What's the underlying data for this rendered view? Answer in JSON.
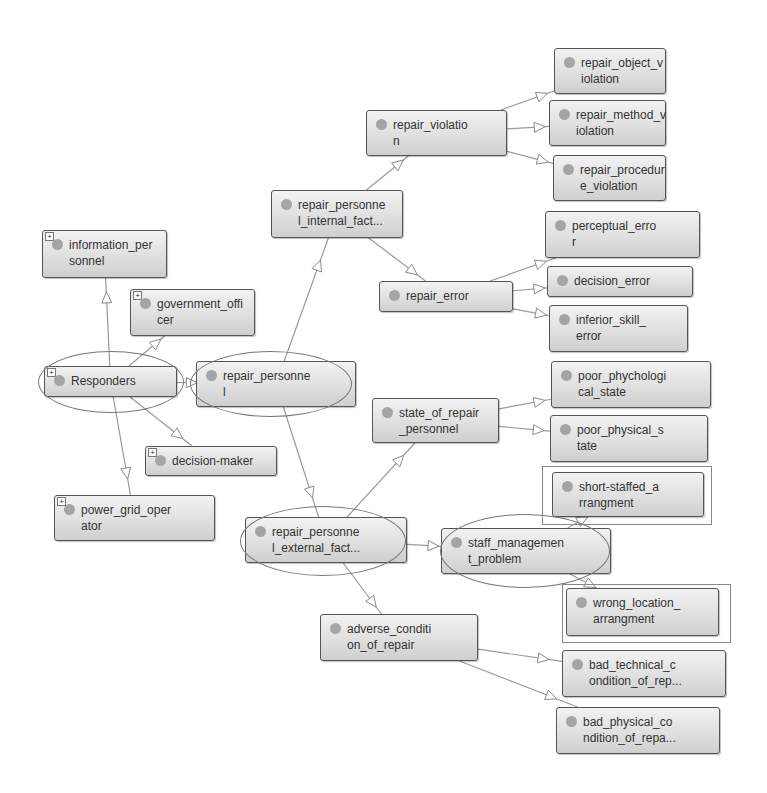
{
  "diagram": {
    "type": "ontology-class-hierarchy",
    "nodes": [
      {
        "id": "repair_object_violation",
        "label": "repair_object_v\niolation",
        "x": 554,
        "y": 48,
        "w": 112,
        "h": 46,
        "expandable": false
      },
      {
        "id": "repair_method_violation",
        "label": "repair_method_v\niolation",
        "x": 549,
        "y": 100,
        "w": 117,
        "h": 46,
        "expandable": false
      },
      {
        "id": "repair_procedure_violation",
        "label": "repair_procedur\ne_violation",
        "x": 553,
        "y": 155,
        "w": 113,
        "h": 46,
        "expandable": false
      },
      {
        "id": "repair_violation",
        "label": "repair_violatio\nn",
        "x": 366,
        "y": 110,
        "w": 141,
        "h": 46,
        "expandable": false
      },
      {
        "id": "repair_personnel_internal_factor",
        "label": "repair_personne\nl_internal_fact...",
        "x": 271,
        "y": 190,
        "w": 132,
        "h": 48,
        "expandable": false
      },
      {
        "id": "perceptual_error",
        "label": "perceptual_erro\nr",
        "x": 545,
        "y": 211,
        "w": 155,
        "h": 47,
        "expandable": false
      },
      {
        "id": "decision_error",
        "label": "decision_error",
        "x": 547,
        "y": 266,
        "w": 146,
        "h": 31,
        "expandable": false
      },
      {
        "id": "inferior_skill_error",
        "label": "inferior_skill_\nerror",
        "x": 549,
        "y": 305,
        "w": 139,
        "h": 47,
        "expandable": false
      },
      {
        "id": "repair_error",
        "label": "repair_error",
        "x": 379,
        "y": 281,
        "w": 134,
        "h": 31,
        "expandable": false
      },
      {
        "id": "information_personnel",
        "label": "information_per\nsonnel",
        "x": 42,
        "y": 230,
        "w": 125,
        "h": 48,
        "expandable": true
      },
      {
        "id": "government_officer",
        "label": "government_offi\ncer",
        "x": 130,
        "y": 289,
        "w": 125,
        "h": 47,
        "expandable": true
      },
      {
        "id": "Responders",
        "label": "Responders",
        "x": 44,
        "y": 366,
        "w": 133,
        "h": 31,
        "expandable": true
      },
      {
        "id": "repair_personnel",
        "label": "repair_personne\nl",
        "x": 196,
        "y": 361,
        "w": 160,
        "h": 46,
        "expandable": false
      },
      {
        "id": "poor_phychological_state",
        "label": "poor_phychologi\ncal_state",
        "x": 551,
        "y": 361,
        "w": 160,
        "h": 47,
        "expandable": false
      },
      {
        "id": "state_of_repair_personnel",
        "label": "state_of_repair\n_personnel",
        "x": 372,
        "y": 398,
        "w": 127,
        "h": 45,
        "expandable": false
      },
      {
        "id": "poor_physical_state",
        "label": "poor_physical_s\ntate",
        "x": 550,
        "y": 415,
        "w": 158,
        "h": 47,
        "expandable": false
      },
      {
        "id": "decision_maker",
        "label": "decision-maker",
        "x": 145,
        "y": 446,
        "w": 132,
        "h": 30,
        "expandable": true
      },
      {
        "id": "power_grid_operator",
        "label": "power_grid_oper\nator",
        "x": 54,
        "y": 495,
        "w": 161,
        "h": 46,
        "expandable": true
      },
      {
        "id": "short_staffed_arrangment",
        "label": "short-staffed_a\nrrangment",
        "x": 552,
        "y": 472,
        "w": 152,
        "h": 45,
        "expandable": false
      },
      {
        "id": "repair_personnel_external_factor",
        "label": "repair_personne\nl_external_fact...",
        "x": 245,
        "y": 517,
        "w": 162,
        "h": 46,
        "expandable": false
      },
      {
        "id": "staff_management_problem",
        "label": "staff_managemen\nt_problem",
        "x": 441,
        "y": 528,
        "w": 170,
        "h": 46,
        "expandable": false
      },
      {
        "id": "wrong_location_arrangment",
        "label": "wrong_location_\narrangment",
        "x": 566,
        "y": 588,
        "w": 153,
        "h": 48,
        "expandable": false
      },
      {
        "id": "adverse_condition_of_repair",
        "label": "adverse_conditi\non_of_repair",
        "x": 320,
        "y": 614,
        "w": 158,
        "h": 47,
        "expandable": false
      },
      {
        "id": "bad_technical_condition_of_repair",
        "label": "bad_technical_c\nondition_of_rep...",
        "x": 562,
        "y": 650,
        "w": 164,
        "h": 47,
        "expandable": false
      },
      {
        "id": "bad_physical_condition_of_repair",
        "label": "bad_physical_co\nndition_of_repa...",
        "x": 556,
        "y": 707,
        "w": 164,
        "h": 47,
        "expandable": false
      }
    ],
    "edges": [
      {
        "from": "repair_violation",
        "to": "repair_object_violation"
      },
      {
        "from": "repair_violation",
        "to": "repair_method_violation"
      },
      {
        "from": "repair_violation",
        "to": "repair_procedure_violation"
      },
      {
        "from": "repair_personnel_internal_factor",
        "to": "repair_violation"
      },
      {
        "from": "repair_personnel_internal_factor",
        "to": "repair_error"
      },
      {
        "from": "repair_error",
        "to": "perceptual_error"
      },
      {
        "from": "repair_error",
        "to": "decision_error"
      },
      {
        "from": "repair_error",
        "to": "inferior_skill_error"
      },
      {
        "from": "repair_personnel",
        "to": "repair_personnel_internal_factor"
      },
      {
        "from": "Responders",
        "to": "information_personnel"
      },
      {
        "from": "Responders",
        "to": "government_officer"
      },
      {
        "from": "Responders",
        "to": "repair_personnel"
      },
      {
        "from": "Responders",
        "to": "decision_maker"
      },
      {
        "from": "Responders",
        "to": "power_grid_operator"
      },
      {
        "from": "repair_personnel",
        "to": "repair_personnel_external_factor"
      },
      {
        "from": "state_of_repair_personnel",
        "to": "poor_phychological_state"
      },
      {
        "from": "state_of_repair_personnel",
        "to": "poor_physical_state"
      },
      {
        "from": "repair_personnel_external_factor",
        "to": "state_of_repair_personnel"
      },
      {
        "from": "repair_personnel_external_factor",
        "to": "staff_management_problem"
      },
      {
        "from": "repair_personnel_external_factor",
        "to": "adverse_condition_of_repair"
      },
      {
        "from": "staff_management_problem",
        "to": "short_staffed_arrangment"
      },
      {
        "from": "staff_management_problem",
        "to": "wrong_location_arrangment"
      },
      {
        "from": "adverse_condition_of_repair",
        "to": "bad_technical_condition_of_repair"
      },
      {
        "from": "adverse_condition_of_repair",
        "to": "bad_physical_condition_of_repair"
      }
    ],
    "highlight_ellipses": [
      {
        "around": "Responders",
        "cx": 110,
        "cy": 381,
        "rx": 72,
        "ry": 30
      },
      {
        "around": "repair_personnel",
        "cx": 270,
        "cy": 383,
        "rx": 80,
        "ry": 32
      },
      {
        "around": "repair_personnel_external_factor",
        "cx": 322,
        "cy": 540,
        "rx": 82,
        "ry": 34
      },
      {
        "around": "staff_management_problem",
        "cx": 524,
        "cy": 550,
        "rx": 84,
        "ry": 36
      }
    ],
    "highlight_frames": [
      {
        "around": "short_staffed_arrangment",
        "x": 542,
        "y": 466,
        "w": 168,
        "h": 57
      },
      {
        "around": "wrong_location_arrangment",
        "x": 562,
        "y": 584,
        "w": 167,
        "h": 57
      }
    ],
    "colors": {
      "node_border": "#555555",
      "node_fill": "#dedede",
      "dot": "#a5a5a5",
      "edge": "#9a9a9a",
      "ellipse": "#777777"
    }
  }
}
